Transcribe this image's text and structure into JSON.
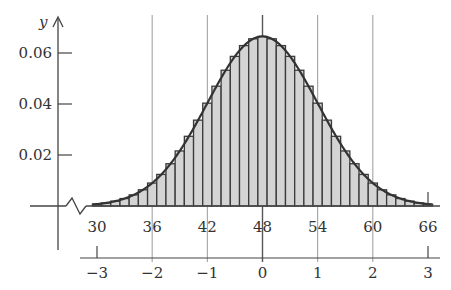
{
  "chart_data": {
    "type": "bar",
    "subtype": "histogram-with-normal-curve",
    "title": "",
    "xlabel": "",
    "ylabel": "y",
    "distribution": {
      "name": "normal",
      "mean": 48,
      "sd": 6
    },
    "bin_width": 1,
    "categories": [
      30,
      31,
      32,
      33,
      34,
      35,
      36,
      37,
      38,
      39,
      40,
      41,
      42,
      43,
      44,
      45,
      46,
      47,
      48,
      49,
      50,
      51,
      52,
      53,
      54,
      55,
      56,
      57,
      58,
      59,
      60,
      61,
      62,
      63,
      64,
      65,
      66
    ],
    "values": [
      0.0007,
      0.0009,
      0.0012,
      0.0017,
      0.0022,
      0.0029,
      0.0038,
      0.0048,
      0.0061,
      0.0076,
      0.0092,
      0.011,
      0.0129,
      0.0149,
      0.017,
      0.019,
      0.0209,
      0.0226,
      0.0239,
      0.0249,
      0.0255,
      0.0257,
      0.0255,
      0.0249,
      0.0239,
      0.0226,
      0.0209,
      0.019,
      0.017,
      0.0149,
      0.0129,
      0.011,
      0.0092,
      0.0076,
      0.0061,
      0.0048,
      0.0038
    ],
    "x_ticks": [
      30,
      36,
      42,
      48,
      54,
      60,
      66
    ],
    "z_ticks": [
      "−3",
      "−2",
      "−1",
      "0",
      "1",
      "2",
      "3"
    ],
    "y_ticks": [
      "0.02",
      "0.04",
      "0.06"
    ],
    "y_tick_values": [
      0.02,
      0.04,
      0.06
    ],
    "xlim": [
      29.5,
      66.5
    ],
    "ylim": [
      0,
      0.07
    ],
    "grid": "vertical lines at 36, 42, 48, 54, 60",
    "legend": null,
    "annotations": [
      "axis break zigzag on x-axis near origin",
      "secondary z-score axis below x-axis"
    ]
  },
  "colors": {
    "bar_fill": "#d4d4d4",
    "bar_stroke": "#3a3a3a",
    "curve": "#333333",
    "axis": "#444444",
    "grid": "#9a9a9a",
    "text": "#333333"
  }
}
